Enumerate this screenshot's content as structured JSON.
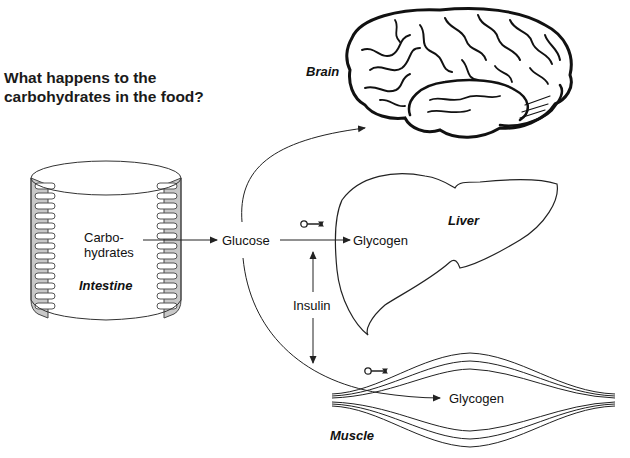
{
  "title": {
    "line1": "What happens to the",
    "line2": "carbohydrates in the food?"
  },
  "organs": {
    "brain": "Brain",
    "liver": "Liver",
    "intestine": "Intestine",
    "muscle": "Muscle"
  },
  "labels": {
    "carbohydrates_line1": "Carbo-",
    "carbohydrates_line2": "hydrates",
    "glucose": "Glucose",
    "glycogen_liver": "Glycogen",
    "glycogen_muscle": "Glycogen",
    "insulin": "Insulin"
  },
  "icons": {
    "key_liver": "key-icon",
    "key_muscle": "key-icon"
  },
  "colors": {
    "line": "#222222",
    "intestine_wall": "#c8c8c8",
    "background": "#ffffff"
  },
  "flows": [
    {
      "from": "Carbohydrates",
      "to": "Glucose"
    },
    {
      "from": "Glucose",
      "to": "Brain"
    },
    {
      "from": "Glucose",
      "to": "Glycogen (Liver)"
    },
    {
      "from": "Glucose",
      "to": "Glycogen (Muscle)"
    },
    {
      "from": "Insulin",
      "to": "Liver / Muscle"
    }
  ]
}
